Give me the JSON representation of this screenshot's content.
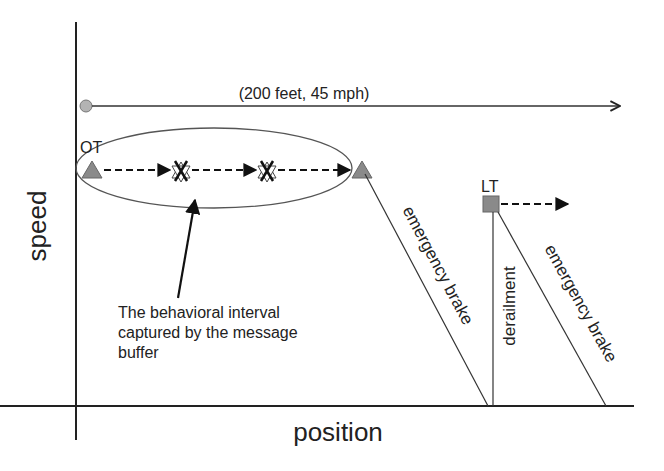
{
  "axes": {
    "x_label": "position",
    "y_label": "speed"
  },
  "top_trajectory": {
    "label": "(200 feet, 45 mph)"
  },
  "markers": {
    "ot_label": "OT",
    "lt_label": "LT"
  },
  "annotation": {
    "line1": "The behavioral interval",
    "line2": "captured by the message",
    "line3": "buffer"
  },
  "segments": {
    "brake_1_label": "emergency brake",
    "derailment_label": "derailment",
    "brake_2_label": "emergency brake"
  },
  "colors": {
    "marker_fill": "#8a8a8a",
    "circle_fill": "#b3b3b3",
    "line": "#333333",
    "ellipse": "#555555"
  }
}
